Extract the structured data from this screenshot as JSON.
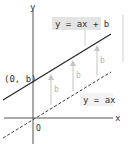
{
  "diagram": {
    "axes": {
      "x_label": "x",
      "y_label": "y",
      "origin_label": "O"
    },
    "lines": [
      {
        "name": "shifted",
        "equation": "y = ax + b",
        "style": "solid",
        "color": "#2a2a2a"
      },
      {
        "name": "base",
        "equation": "y = ax",
        "style": "dashed",
        "color": "#3a3a3a"
      }
    ],
    "intercept_label": "(0, b)",
    "shift_arrows": [
      {
        "label": "b"
      },
      {
        "label": "b"
      },
      {
        "label": "b"
      }
    ],
    "colors": {
      "axis": "#555555",
      "arrow": "#c4c4c4",
      "label_box_bg": "#e4e4e4",
      "label_box_light_bg": "#f2f2f2",
      "side_rule": "#d0d0d0"
    }
  }
}
